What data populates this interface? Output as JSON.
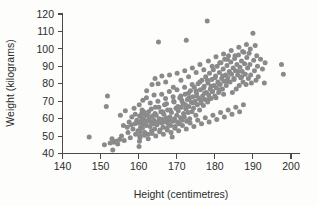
{
  "chart_data": {
    "type": "scatter",
    "title": "",
    "xlabel": "Height (centimetres)",
    "ylabel": "Weight (kilograms)",
    "xlim": [
      140,
      200
    ],
    "ylim": [
      40,
      120
    ],
    "xticks": [
      140,
      150,
      160,
      170,
      180,
      190,
      200
    ],
    "yticks": [
      40,
      50,
      60,
      70,
      80,
      90,
      100,
      110,
      120
    ],
    "grid": false,
    "legend": false,
    "marker_color": "#8a8a8a",
    "marker_size": 2.5,
    "axis_color": "#4a4a4a",
    "background_color": "#fdfdfc",
    "series": [
      {
        "name": "Height vs Weight",
        "points": [
          [
            147.0,
            49.5
          ],
          [
            151.0,
            45.0
          ],
          [
            151.5,
            67.0
          ],
          [
            151.8,
            73.0
          ],
          [
            152.5,
            46.0
          ],
          [
            153.0,
            48.5
          ],
          [
            153.2,
            42.0
          ],
          [
            153.5,
            46.5
          ],
          [
            154.0,
            47.0
          ],
          [
            154.5,
            45.5
          ],
          [
            155.0,
            48.0
          ],
          [
            155.2,
            62.0
          ],
          [
            155.5,
            50.0
          ],
          [
            156.0,
            56.0
          ],
          [
            156.2,
            47.5
          ],
          [
            156.5,
            64.5
          ],
          [
            157.0,
            55.0
          ],
          [
            157.2,
            52.0
          ],
          [
            157.5,
            58.0
          ],
          [
            157.8,
            49.0
          ],
          [
            158.0,
            56.5
          ],
          [
            158.2,
            61.0
          ],
          [
            158.5,
            54.0
          ],
          [
            158.8,
            66.0
          ],
          [
            159.0,
            57.0
          ],
          [
            159.2,
            51.0
          ],
          [
            159.5,
            59.0
          ],
          [
            159.8,
            53.0
          ],
          [
            160.0,
            57.5
          ],
          [
            160.1,
            44.0
          ],
          [
            160.2,
            47.0
          ],
          [
            160.3,
            50.0
          ],
          [
            160.4,
            52.5
          ],
          [
            160.5,
            55.0
          ],
          [
            160.6,
            58.0
          ],
          [
            160.7,
            60.5
          ],
          [
            160.8,
            63.0
          ],
          [
            160.9,
            65.0
          ],
          [
            161.0,
            54.5
          ],
          [
            161.2,
            57.0
          ],
          [
            161.4,
            59.5
          ],
          [
            161.6,
            52.0
          ],
          [
            161.8,
            62.0
          ],
          [
            162.0,
            56.0
          ],
          [
            162.2,
            58.5
          ],
          [
            162.4,
            51.0
          ],
          [
            162.6,
            64.0
          ],
          [
            162.8,
            60.0
          ],
          [
            163.0,
            55.5
          ],
          [
            163.2,
            58.0
          ],
          [
            163.4,
            53.0
          ],
          [
            163.6,
            61.5
          ],
          [
            163.8,
            57.0
          ],
          [
            164.0,
            59.0
          ],
          [
            164.2,
            54.0
          ],
          [
            164.4,
            66.5
          ],
          [
            164.6,
            62.0
          ],
          [
            164.8,
            56.5
          ],
          [
            165.0,
            58.0
          ],
          [
            165.2,
            104.0
          ],
          [
            165.4,
            60.0
          ],
          [
            165.6,
            53.5
          ],
          [
            165.8,
            64.0
          ],
          [
            166.0,
            57.5
          ],
          [
            166.2,
            59.5
          ],
          [
            166.4,
            55.0
          ],
          [
            166.6,
            62.5
          ],
          [
            166.8,
            68.0
          ],
          [
            167.0,
            58.0
          ],
          [
            167.2,
            60.5
          ],
          [
            167.4,
            54.5
          ],
          [
            167.6,
            65.0
          ],
          [
            167.8,
            57.0
          ],
          [
            168.0,
            59.0
          ],
          [
            168.2,
            61.0
          ],
          [
            168.4,
            56.0
          ],
          [
            168.6,
            63.5
          ],
          [
            168.8,
            49.5
          ],
          [
            169.0,
            58.5
          ],
          [
            169.2,
            70.0
          ],
          [
            169.4,
            60.0
          ],
          [
            169.6,
            55.5
          ],
          [
            169.8,
            66.0
          ],
          [
            170.0,
            62.0
          ],
          [
            170.2,
            58.0
          ],
          [
            170.4,
            64.5
          ],
          [
            170.6,
            57.0
          ],
          [
            170.8,
            72.0
          ],
          [
            171.0,
            60.5
          ],
          [
            171.2,
            66.5
          ],
          [
            171.4,
            59.0
          ],
          [
            171.6,
            69.0
          ],
          [
            171.8,
            63.0
          ],
          [
            172.0,
            61.0
          ],
          [
            172.2,
            74.0
          ],
          [
            172.4,
            65.5
          ],
          [
            172.5,
            105.0
          ],
          [
            172.6,
            58.5
          ],
          [
            172.8,
            71.0
          ],
          [
            173.0,
            63.5
          ],
          [
            173.2,
            67.0
          ],
          [
            173.4,
            60.0
          ],
          [
            173.6,
            76.0
          ],
          [
            173.8,
            69.5
          ],
          [
            174.0,
            64.0
          ],
          [
            174.2,
            72.5
          ],
          [
            174.4,
            66.0
          ],
          [
            174.6,
            78.0
          ],
          [
            174.8,
            70.0
          ],
          [
            175.0,
            62.0
          ],
          [
            175.2,
            74.5
          ],
          [
            175.4,
            68.0
          ],
          [
            175.6,
            80.0
          ],
          [
            175.8,
            71.5
          ],
          [
            176.0,
            65.0
          ],
          [
            176.2,
            76.5
          ],
          [
            176.4,
            69.0
          ],
          [
            176.6,
            82.0
          ],
          [
            176.8,
            73.0
          ],
          [
            177.0,
            67.5
          ],
          [
            177.2,
            78.5
          ],
          [
            177.4,
            71.0
          ],
          [
            177.6,
            84.0
          ],
          [
            177.8,
            75.0
          ],
          [
            178.0,
            116.0
          ],
          [
            178.1,
            69.5
          ],
          [
            178.2,
            80.5
          ],
          [
            178.4,
            73.5
          ],
          [
            178.6,
            86.0
          ],
          [
            178.8,
            77.0
          ],
          [
            179.0,
            71.5
          ],
          [
            179.2,
            82.5
          ],
          [
            179.4,
            75.5
          ],
          [
            179.6,
            88.0
          ],
          [
            179.8,
            79.0
          ],
          [
            180.0,
            73.0
          ],
          [
            180.2,
            84.5
          ],
          [
            180.4,
            77.5
          ],
          [
            180.6,
            90.0
          ],
          [
            180.8,
            81.0
          ],
          [
            181.0,
            75.0
          ],
          [
            181.2,
            86.5
          ],
          [
            181.4,
            79.5
          ],
          [
            181.6,
            92.0
          ],
          [
            181.8,
            83.0
          ],
          [
            182.0,
            77.0
          ],
          [
            182.2,
            88.5
          ],
          [
            182.4,
            81.5
          ],
          [
            182.6,
            94.0
          ],
          [
            182.8,
            85.0
          ],
          [
            183.0,
            79.0
          ],
          [
            183.2,
            90.5
          ],
          [
            183.4,
            83.5
          ],
          [
            183.6,
            96.0
          ],
          [
            183.8,
            87.0
          ],
          [
            184.0,
            81.0
          ],
          [
            184.2,
            92.5
          ],
          [
            184.4,
            85.5
          ],
          [
            184.6,
            75.0
          ],
          [
            184.8,
            89.0
          ],
          [
            185.0,
            83.0
          ],
          [
            185.2,
            94.5
          ],
          [
            185.4,
            87.5
          ],
          [
            185.6,
            77.0
          ],
          [
            185.8,
            91.0
          ],
          [
            186.0,
            85.0
          ],
          [
            186.2,
            96.5
          ],
          [
            186.4,
            79.0
          ],
          [
            186.6,
            89.5
          ],
          [
            186.8,
            83.5
          ],
          [
            187.0,
            93.0
          ],
          [
            187.2,
            87.0
          ],
          [
            187.4,
            81.0
          ],
          [
            187.6,
            98.0
          ],
          [
            187.8,
            91.5
          ],
          [
            188.0,
            85.5
          ],
          [
            188.2,
            79.5
          ],
          [
            188.4,
            95.0
          ],
          [
            188.6,
            89.0
          ],
          [
            188.8,
            83.0
          ],
          [
            189.0,
            97.5
          ],
          [
            189.2,
            91.0
          ],
          [
            189.4,
            85.0
          ],
          [
            189.6,
            80.5
          ],
          [
            190.0,
            109.0
          ],
          [
            190.2,
            93.5
          ],
          [
            190.4,
            87.5
          ],
          [
            190.6,
            102.0
          ],
          [
            190.8,
            82.0
          ],
          [
            191.0,
            96.0
          ],
          [
            191.2,
            90.0
          ],
          [
            191.4,
            84.0
          ],
          [
            192.0,
            94.0
          ],
          [
            192.5,
            88.5
          ],
          [
            193.0,
            80.5
          ],
          [
            193.2,
            92.0
          ],
          [
            197.5,
            91.0
          ],
          [
            198.0,
            85.5
          ],
          [
            162.1,
            76.0
          ],
          [
            163.5,
            79.5
          ],
          [
            164.3,
            83.0
          ],
          [
            165.1,
            80.0
          ],
          [
            166.1,
            84.5
          ],
          [
            167.1,
            81.0
          ],
          [
            168.1,
            85.0
          ],
          [
            169.1,
            78.0
          ],
          [
            170.1,
            86.0
          ],
          [
            171.1,
            82.0
          ],
          [
            172.1,
            87.5
          ],
          [
            173.1,
            84.0
          ],
          [
            174.1,
            89.0
          ],
          [
            175.1,
            86.5
          ],
          [
            176.1,
            91.0
          ],
          [
            177.1,
            88.0
          ],
          [
            178.3,
            93.0
          ],
          [
            179.3,
            90.0
          ],
          [
            180.3,
            95.5
          ],
          [
            181.3,
            92.0
          ],
          [
            182.3,
            97.0
          ],
          [
            183.3,
            94.0
          ],
          [
            184.3,
            99.0
          ],
          [
            185.3,
            96.0
          ],
          [
            186.3,
            101.0
          ],
          [
            187.3,
            98.5
          ],
          [
            188.3,
            102.5
          ],
          [
            189.3,
            100.0
          ],
          [
            160.15,
            68.0
          ],
          [
            161.1,
            70.5
          ],
          [
            162.05,
            72.0
          ],
          [
            163.05,
            69.0
          ],
          [
            164.05,
            73.5
          ],
          [
            165.05,
            70.0
          ],
          [
            166.05,
            74.0
          ],
          [
            167.05,
            71.5
          ],
          [
            168.05,
            75.5
          ],
          [
            169.05,
            72.5
          ],
          [
            170.05,
            76.5
          ],
          [
            171.05,
            73.0
          ],
          [
            172.05,
            78.0
          ],
          [
            173.05,
            74.5
          ],
          [
            174.05,
            79.5
          ],
          [
            175.05,
            76.0
          ],
          [
            176.05,
            81.0
          ],
          [
            177.05,
            77.5
          ],
          [
            178.05,
            82.0
          ],
          [
            179.05,
            78.5
          ],
          [
            180.05,
            83.5
          ],
          [
            181.05,
            80.0
          ],
          [
            182.05,
            84.5
          ],
          [
            183.05,
            81.5
          ],
          [
            184.05,
            86.0
          ],
          [
            185.05,
            82.5
          ],
          [
            186.05,
            87.0
          ],
          [
            187.05,
            84.0
          ],
          [
            159.1,
            62.5
          ],
          [
            160.25,
            61.5
          ],
          [
            161.3,
            64.0
          ],
          [
            162.3,
            62.0
          ],
          [
            163.3,
            65.5
          ],
          [
            164.3,
            63.0
          ],
          [
            165.3,
            66.5
          ],
          [
            166.3,
            64.0
          ],
          [
            167.3,
            68.5
          ],
          [
            168.3,
            65.0
          ],
          [
            169.3,
            69.5
          ],
          [
            170.3,
            67.0
          ],
          [
            171.3,
            70.5
          ],
          [
            172.3,
            68.0
          ],
          [
            173.3,
            72.0
          ],
          [
            174.3,
            69.0
          ],
          [
            175.3,
            73.0
          ],
          [
            176.3,
            70.5
          ],
          [
            177.3,
            74.5
          ],
          [
            178.3,
            71.0
          ],
          [
            179.3,
            75.5
          ],
          [
            180.3,
            72.0
          ],
          [
            181.3,
            76.5
          ],
          [
            182.3,
            74.0
          ],
          [
            160.35,
            49.0
          ],
          [
            161.5,
            50.5
          ],
          [
            162.5,
            48.5
          ],
          [
            163.5,
            51.5
          ],
          [
            164.5,
            50.0
          ],
          [
            165.5,
            52.5
          ],
          [
            166.5,
            51.0
          ],
          [
            167.5,
            53.5
          ],
          [
            168.5,
            52.0
          ],
          [
            169.5,
            54.5
          ],
          [
            170.5,
            53.0
          ],
          [
            171.5,
            56.0
          ],
          [
            172.5,
            54.0
          ],
          [
            173.5,
            57.5
          ],
          [
            174.5,
            55.5
          ],
          [
            175.5,
            59.0
          ],
          [
            176.5,
            57.0
          ],
          [
            177.5,
            60.5
          ],
          [
            178.5,
            58.0
          ],
          [
            179.5,
            62.0
          ],
          [
            180.5,
            59.5
          ],
          [
            181.5,
            63.5
          ],
          [
            182.5,
            61.0
          ],
          [
            183.5,
            65.0
          ],
          [
            184.5,
            62.5
          ],
          [
            185.5,
            66.5
          ],
          [
            186.5,
            64.0
          ],
          [
            187.5,
            68.0
          ]
        ]
      }
    ]
  }
}
